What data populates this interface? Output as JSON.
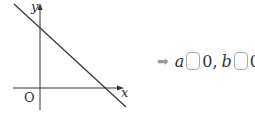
{
  "graph": {
    "y_axis_label": "y",
    "x_axis_label": "x",
    "origin_label": "O",
    "line": "decreasing line with positive y-intercept and positive x-intercept"
  },
  "answer": {
    "arrow": "➡",
    "var_a": "a",
    "zero_a": "0,",
    "var_b": "b",
    "zero_b": "0"
  }
}
